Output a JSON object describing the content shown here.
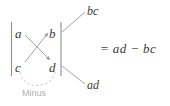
{
  "figure": {
    "type": "determinant-diagram",
    "matrix": {
      "entries": [
        {
          "id": "a",
          "text": "a",
          "row": 0,
          "col": 0
        },
        {
          "id": "b",
          "text": "b",
          "row": 0,
          "col": 1
        },
        {
          "id": "c",
          "text": "c",
          "row": 1,
          "col": 0
        },
        {
          "id": "d",
          "text": "d",
          "row": 1,
          "col": 1
        }
      ]
    },
    "callouts": [
      {
        "id": "bc",
        "text": "bc",
        "position": "top-right"
      },
      {
        "id": "ad",
        "text": "ad",
        "position": "bottom-right"
      }
    ],
    "annotations": [
      {
        "id": "minus",
        "text": "Minus",
        "style": "dashed-arc",
        "color": "#b0b0b0"
      }
    ],
    "equation": "= ad − bc",
    "colors": {
      "text": "#3a3a3a",
      "rule": "#9a9a9a",
      "annotation": "#b0b0b0",
      "background": "#ffffff"
    }
  }
}
